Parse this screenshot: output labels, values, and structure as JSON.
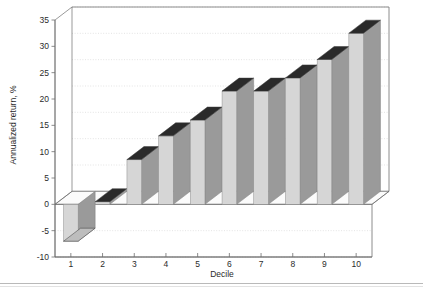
{
  "chart_data": {
    "type": "bar",
    "title": "",
    "subtitle": "",
    "xlabel": "Decile",
    "ylabel": "Annualized return, %",
    "categories": [
      "1",
      "2",
      "3",
      "4",
      "5",
      "6",
      "7",
      "8",
      "9",
      "10"
    ],
    "values": [
      -7.0,
      0.5,
      8.5,
      13.0,
      16.0,
      21.5,
      21.5,
      24.0,
      27.5,
      32.5
    ],
    "ylim": [
      -10,
      35
    ],
    "yticks": [
      -10,
      -5,
      0,
      5,
      10,
      15,
      20,
      25,
      30,
      35
    ],
    "ytick_labels": [
      "-10",
      "-5",
      "0",
      "5",
      "10",
      "15",
      "20",
      "25",
      "30",
      "35"
    ],
    "xtick_labels": [
      "1",
      "2",
      "3",
      "4",
      "5",
      "6",
      "7",
      "8",
      "9",
      "10"
    ],
    "grid": true,
    "grid_axis": "y",
    "legend": "none",
    "style": "3d-column",
    "bar_face_color": "#d6d6d6",
    "bar_side_color": "#9a9a9a",
    "bar_top_color": "#2a2a2a",
    "grid_color": "#d9d9d9",
    "axis_color": "#6e6e6e",
    "background_color": "#ffffff"
  },
  "axis": {
    "y_title": "Annualized return, %",
    "x_title": "Decile"
  }
}
